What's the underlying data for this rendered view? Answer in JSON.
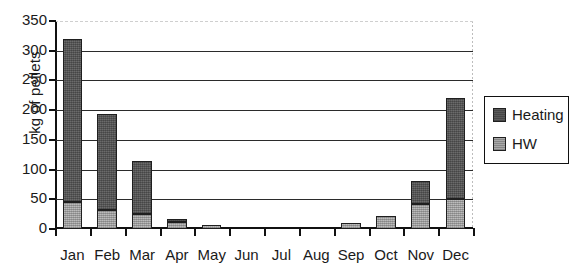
{
  "chart_data": {
    "type": "bar",
    "subtype": "stacked-column",
    "title": "",
    "xlabel": "",
    "ylabel": "kg of pellets",
    "ylim": [
      0,
      350
    ],
    "ytick_step": 50,
    "yticks": [
      0,
      50,
      100,
      150,
      200,
      250,
      300,
      350
    ],
    "ytick_labels": [
      "0",
      "50",
      "100",
      "150",
      "200",
      "250",
      "300",
      "350"
    ],
    "grid": true,
    "grid_axis": "y",
    "legend_position": "right",
    "categories": [
      "Jan",
      "Feb",
      "Mar",
      "Apr",
      "May",
      "Jun",
      "Jul",
      "Aug",
      "Sep",
      "Oct",
      "Nov",
      "Dec"
    ],
    "series": [
      {
        "name": "HW",
        "color": "#a9a9a9",
        "stack_order": 0,
        "values": [
          45,
          32,
          25,
          12,
          6,
          0,
          0,
          0,
          10,
          22,
          42,
          50
        ]
      },
      {
        "name": "Heating",
        "color": "#5a5a5a",
        "stack_order": 1,
        "values": [
          275,
          161,
          90,
          5,
          0,
          0,
          0,
          0,
          0,
          0,
          38,
          170
        ]
      }
    ],
    "totals": [
      320,
      193,
      115,
      17,
      6,
      0,
      0,
      0,
      10,
      22,
      80,
      220
    ]
  },
  "legend": {
    "items": [
      {
        "label": "Heating",
        "swatch": "heating"
      },
      {
        "label": "HW",
        "swatch": "hw"
      }
    ]
  },
  "axis": {
    "y_title": "kg of pellets"
  }
}
